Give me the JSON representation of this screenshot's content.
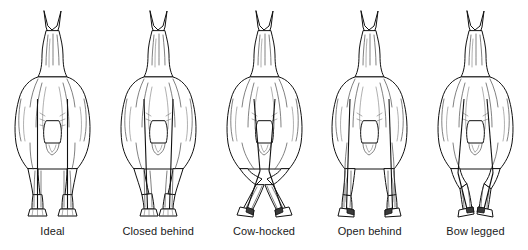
{
  "diagram": {
    "background_color": "#ffffff",
    "line_color": "#111111",
    "label_color": "#1a1a1a",
    "view": "rear",
    "figure_count": 5,
    "figures": [
      {
        "id": "ideal",
        "label": "Ideal",
        "description": "Plumb line drops straight from point of buttock through hock, cannon and fetlock; hooves parallel and square.",
        "hock_deviation": "none",
        "hoof_direction": "straight ahead",
        "stance_width": "normal"
      },
      {
        "id": "closed-behind",
        "label": "Closed behind",
        "description": "Legs angle inward from hip to hoof; feet stand too close together under the body.",
        "hock_deviation": "inward",
        "hoof_direction": "straight ahead",
        "stance_width": "narrow"
      },
      {
        "id": "cow-hocked",
        "label": "Cow-hocked",
        "description": "Hocks turn toward each other while the cannons and feet point outward.",
        "hock_deviation": "hocks inward",
        "hoof_direction": "toed out",
        "stance_width": "wide at the feet"
      },
      {
        "id": "open-behind",
        "label": "Open behind",
        "description": "Legs set too far apart; feet stand wide outside the line of the body.",
        "hock_deviation": "outward",
        "hoof_direction": "straight ahead",
        "stance_width": "wide"
      },
      {
        "id": "bow-legged",
        "label": "Bow legged",
        "description": "Hocks bow away from each other and the feet turn inward.",
        "hock_deviation": "hocks outward",
        "hoof_direction": "toed in",
        "stance_width": "narrow at the feet"
      }
    ]
  }
}
